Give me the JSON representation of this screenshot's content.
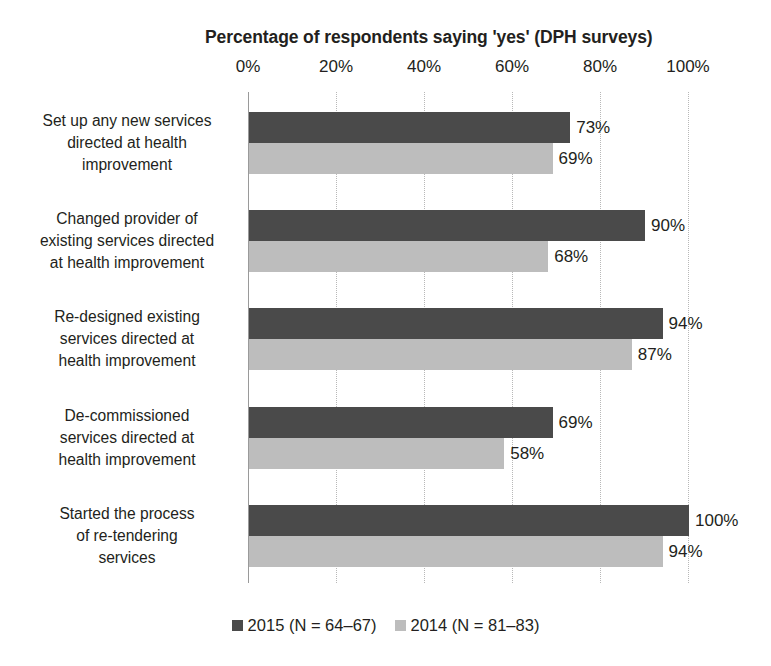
{
  "chart_data": {
    "type": "bar",
    "orientation": "horizontal",
    "title": "Percentage of respondents saying 'yes' (DPH surveys)",
    "xlabel": "",
    "ylabel": "",
    "xlim": [
      0,
      100
    ],
    "grid": true,
    "legend_position": "bottom",
    "tick_labels": [
      "0%",
      "20%",
      "40%",
      "60%",
      "80%",
      "100%"
    ],
    "tick_values": [
      0,
      20,
      40,
      60,
      80,
      100
    ],
    "categories": [
      "Set up any new services directed at health improvement",
      "Changed provider of existing services directed at health improvement",
      "Re-designed existing services directed at health improvement",
      "De-commissioned services directed at health improvement",
      "Started the process of re-tendering services"
    ],
    "category_lines": [
      [
        "Set up any new services",
        "directed at health",
        "improvement"
      ],
      [
        "Changed provider of",
        "existing services directed",
        "at health improvement"
      ],
      [
        "Re-designed existing",
        "services directed at",
        "health improvement"
      ],
      [
        "De-commissioned",
        "services directed at",
        "health improvement"
      ],
      [
        "Started the process",
        "of re-tendering",
        "services"
      ]
    ],
    "series": [
      {
        "name": "2015 (N = 64–67)",
        "color": "#4a4a4a",
        "values": [
          73,
          90,
          94,
          69,
          100
        ],
        "labels": [
          "73%",
          "90%",
          "94%",
          "69%",
          "100%"
        ]
      },
      {
        "name": "2014 (N = 81–83)",
        "color": "#bdbdbd",
        "values": [
          69,
          68,
          87,
          58,
          94
        ],
        "labels": [
          "69%",
          "68%",
          "87%",
          "58%",
          "94%"
        ]
      }
    ]
  },
  "legend": {
    "items": [
      {
        "label": "2015 (N = 64–67)",
        "color": "#4a4a4a"
      },
      {
        "label": "2014 (N = 81–83)",
        "color": "#bdbdbd"
      }
    ]
  },
  "colors": {
    "series_2015": "#4a4a4a",
    "series_2014": "#bdbdbd",
    "text": "#231f20",
    "gridline": "#b8b8b8",
    "axis": "#9a9a9a",
    "background": "#ffffff"
  }
}
